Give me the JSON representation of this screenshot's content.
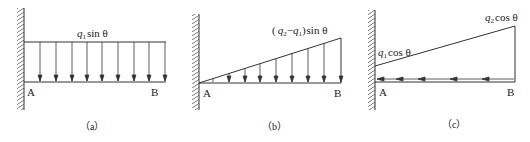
{
  "diagrams": [
    {
      "id": "a",
      "caption": "（a）",
      "load_label": {
        "q": "q",
        "sub": "1",
        "rest": "sin θ"
      },
      "point_a": "A",
      "point_b": "B",
      "load_type": "uniform-vertical"
    },
    {
      "id": "b",
      "caption": "（b）",
      "load_label": {
        "open": "(",
        "q2": "q",
        "sub2": "2",
        "minus": "−",
        "q1": "q",
        "sub1": "1",
        "close": ")",
        "rest": "sin θ"
      },
      "point_a": "A",
      "point_b": "B",
      "load_type": "triangular-vertical"
    },
    {
      "id": "c",
      "caption": "（c）",
      "load_label_left": {
        "q": "q",
        "sub": "1",
        "rest": "cos θ"
      },
      "load_label_right": {
        "q": "q",
        "sub": "2",
        "rest": "cos θ"
      },
      "point_a": "A",
      "point_b": "B",
      "load_type": "trapezoidal-axial"
    }
  ],
  "colors": {
    "line": "#333333",
    "hatch": "#555555",
    "text": "#222222"
  }
}
